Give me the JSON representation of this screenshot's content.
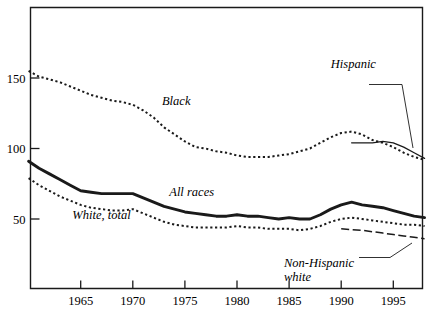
{
  "chart_data": {
    "type": "line",
    "title": "",
    "subtitle": "",
    "xlabel": "",
    "ylabel": "",
    "xlim": [
      1960,
      1998
    ],
    "ylim": [
      0,
      185
    ],
    "grid": false,
    "legend_position": "inline-annotations",
    "x_ticks": [
      "1965",
      "1970",
      "1975",
      "1980",
      "1985",
      "1990",
      "1995"
    ],
    "x_tick_values": [
      1965,
      1970,
      1975,
      1980,
      1985,
      1990,
      1995
    ],
    "y_ticks": [
      "50",
      "100",
      "150"
    ],
    "y_tick_values": [
      50,
      100,
      150
    ],
    "series": [
      {
        "name": "Black",
        "style": "dotted",
        "label": "Black",
        "label_x": 1972.8,
        "label_y": 131,
        "x": [
          1960,
          1961,
          1962,
          1963,
          1964,
          1965,
          1966,
          1967,
          1968,
          1969,
          1970,
          1971,
          1972,
          1973,
          1974,
          1975,
          1976,
          1977,
          1978,
          1979,
          1980,
          1981,
          1982,
          1983,
          1984,
          1985,
          1986,
          1987,
          1988,
          1989,
          1990,
          1991,
          1992,
          1993,
          1994,
          1995,
          1996,
          1997,
          1998
        ],
        "values": [
          155,
          151,
          149,
          147,
          144,
          141,
          138,
          136,
          134,
          133,
          131,
          127,
          122,
          115,
          110,
          105,
          101,
          100,
          98,
          97,
          95,
          94,
          94,
          94,
          95,
          96,
          98,
          100,
          104,
          108,
          111,
          112,
          110,
          106,
          104,
          101,
          97,
          94,
          92
        ]
      },
      {
        "name": "Hispanic",
        "style": "solid-thin",
        "label": "Hispanic",
        "label_x": 1989.0,
        "label_y": 157,
        "x": [
          1991,
          1992,
          1993,
          1994,
          1995,
          1996,
          1997,
          1998
        ],
        "values": [
          104,
          104,
          104,
          105,
          104,
          101,
          97,
          93
        ]
      },
      {
        "name": "All races",
        "style": "solid-thick",
        "label": "All races",
        "label_x": 1973.5,
        "label_y": 66,
        "x": [
          1960,
          1961,
          1962,
          1963,
          1964,
          1965,
          1966,
          1967,
          1968,
          1969,
          1970,
          1971,
          1972,
          1973,
          1974,
          1975,
          1976,
          1977,
          1978,
          1979,
          1980,
          1981,
          1982,
          1983,
          1984,
          1985,
          1986,
          1987,
          1988,
          1989,
          1990,
          1991,
          1992,
          1993,
          1994,
          1995,
          1996,
          1997,
          1998
        ],
        "values": [
          91,
          86,
          82,
          78,
          74,
          70,
          69,
          68,
          68,
          68,
          68,
          65,
          62,
          59,
          57,
          55,
          54,
          53,
          52,
          52,
          53,
          52,
          52,
          51,
          50,
          51,
          50,
          50,
          53,
          57,
          60,
          62,
          60,
          59,
          58,
          56,
          54,
          52,
          51
        ]
      },
      {
        "name": "White, total",
        "style": "dotted",
        "label": "White, total",
        "label_x": 1964.2,
        "label_y": 50,
        "x": [
          1960,
          1961,
          1962,
          1963,
          1964,
          1965,
          1966,
          1967,
          1968,
          1969,
          1970,
          1971,
          1972,
          1973,
          1974,
          1975,
          1976,
          1977,
          1978,
          1979,
          1980,
          1981,
          1982,
          1983,
          1984,
          1985,
          1986,
          1987,
          1988,
          1989,
          1990,
          1991,
          1992,
          1993,
          1994,
          1995,
          1996,
          1997,
          1998
        ],
        "values": [
          79,
          74,
          70,
          66,
          63,
          60,
          58,
          57,
          56,
          56,
          57,
          54,
          51,
          48,
          46,
          45,
          44,
          44,
          44,
          44,
          45,
          44,
          44,
          43,
          43,
          43,
          42,
          43,
          45,
          48,
          50,
          51,
          50,
          49,
          48,
          47,
          46,
          46,
          45
        ]
      },
      {
        "name": "Non-Hispanic white",
        "style": "dash-dot",
        "label": "Non-Hispanic white",
        "label_line1": "Non-Hispanic",
        "label_line2": "white",
        "label_x": 1984.5,
        "label_y": 16,
        "x": [
          1990,
          1991,
          1992,
          1993,
          1994,
          1995,
          1996,
          1997,
          1998
        ],
        "values": [
          43,
          42.5,
          42,
          41,
          40,
          39,
          38,
          37,
          36
        ]
      }
    ],
    "annotations": [
      {
        "name": "hispanic-leader",
        "text": "Hispanic"
      },
      {
        "name": "non-hispanic-white-leader",
        "text": "Non-Hispanic white"
      }
    ]
  },
  "colors": {
    "ink": "#1a1a1a",
    "background": "#ffffff"
  }
}
